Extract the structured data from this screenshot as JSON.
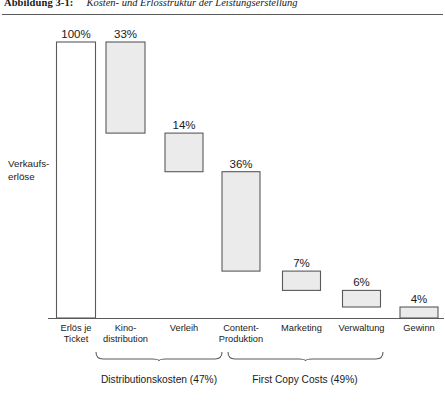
{
  "caption": {
    "label": "Abbildung 3-1:",
    "text": "Kosten- und Erlösstruktur der Leistungserstellung"
  },
  "axis": {
    "y_label_line1": "Verkaufs-",
    "y_label_line2": "erlöse"
  },
  "chart_data": {
    "type": "bar",
    "subtype": "waterfall",
    "title": "Kosten- und Erlösstruktur der Leistungserstellung",
    "xlabel": "",
    "ylabel": "Verkaufserlöse",
    "ylim": [
      0,
      100
    ],
    "grid": false,
    "legend": "none",
    "categories": [
      "Erlös je Ticket",
      "Kino-distribution",
      "Verleih",
      "Content-Produktion",
      "Marketing",
      "Verwaltung",
      "Gewinn"
    ],
    "category_lines": [
      [
        "Erlös je",
        "Ticket"
      ],
      [
        "Kino-",
        "distribution"
      ],
      [
        "Verleih",
        ""
      ],
      [
        "Content-",
        "Produktion"
      ],
      [
        "Marketing",
        ""
      ],
      [
        "Verwaltung",
        ""
      ],
      [
        "Gewinn",
        ""
      ]
    ],
    "values": [
      100,
      33,
      14,
      36,
      7,
      6,
      4
    ],
    "value_labels": [
      "100%",
      "33%",
      "14%",
      "36%",
      "7%",
      "6%",
      "4%"
    ],
    "bar_kinds": [
      "total",
      "decrease",
      "decrease",
      "decrease",
      "decrease",
      "decrease",
      "total"
    ],
    "cumulative_tops": [
      100,
      100,
      67,
      53,
      17,
      10,
      4
    ],
    "cumulative_bottoms": [
      0,
      67,
      53,
      17,
      10,
      4,
      0
    ],
    "fill_colors": [
      "#ffffff",
      "#ebebeb",
      "#ebebeb",
      "#ebebeb",
      "#ebebeb",
      "#ebebeb",
      "#ebebeb"
    ],
    "stroke_color": "#5a5a5a",
    "annotations": [
      {
        "label": "Distributionskosten (47%)",
        "spans": [
          "Kino-distribution",
          "Verleih"
        ],
        "value": 47
      },
      {
        "label": "First Copy Costs (49%)",
        "spans": [
          "Content-Produktion",
          "Marketing",
          "Verwaltung"
        ],
        "value": 49
      }
    ]
  },
  "annotations": {
    "bracket1_label": "Distributionskosten (47%)",
    "bracket2_label": "First Copy Costs (49%)"
  }
}
